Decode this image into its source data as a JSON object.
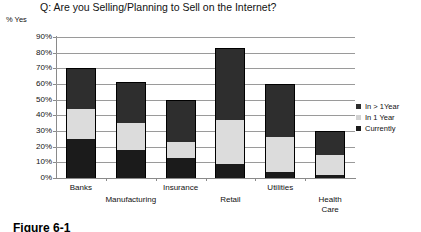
{
  "chart_data": {
    "type": "bar",
    "title": "Q: Are you Selling/Planning to Sell on the Internet?",
    "subtype": "stacked",
    "xlabel": "",
    "ylabel": "% Yes",
    "ylim": [
      0,
      90
    ],
    "ytick_labels": [
      "0%",
      "10%",
      "20%",
      "30%",
      "40%",
      "50%",
      "60%",
      "70%",
      "80%",
      "90%"
    ],
    "ytick_values": [
      0,
      10,
      20,
      30,
      40,
      50,
      60,
      70,
      80,
      90
    ],
    "grid": true,
    "legend_position": "right",
    "categories": [
      "Banks",
      "Manufacturing",
      "Insurance",
      "Retail",
      "Utilities",
      "Health Care"
    ],
    "series": [
      {
        "name": "Currently",
        "color": "#1b1b1b",
        "values": [
          25,
          18,
          13,
          9,
          4,
          2
        ]
      },
      {
        "name": "In 1 Year",
        "color": "#dcdcdc",
        "values": [
          19,
          17,
          10,
          28,
          22,
          13
        ]
      },
      {
        "name": "In > 1Year",
        "color": "#2e2e2e",
        "values": [
          26,
          26,
          27,
          46,
          34,
          15
        ]
      }
    ],
    "totals": [
      70,
      61,
      50,
      83,
      60,
      30
    ]
  },
  "legend": {
    "items": [
      {
        "label": "In > 1Year",
        "swatch": "dark-gray"
      },
      {
        "label": "In 1 Year",
        "swatch": "light-gray"
      },
      {
        "label": "Currently",
        "swatch": "black"
      }
    ]
  },
  "caption": {
    "text": "Figure 6-1"
  }
}
